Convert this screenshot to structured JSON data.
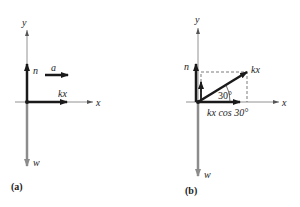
{
  "panels": [
    {
      "id": "a",
      "caption": "(a)",
      "axes": {
        "x_label": "x",
        "y_label": "y"
      },
      "vectors": [
        {
          "name": "n",
          "label": "n",
          "direction": "up"
        },
        {
          "name": "a",
          "label": "a",
          "direction": "right"
        },
        {
          "name": "kx",
          "label": "kx",
          "direction": "right"
        },
        {
          "name": "w",
          "label": "w",
          "direction": "down"
        }
      ]
    },
    {
      "id": "b",
      "caption": "(b)",
      "axes": {
        "x_label": "x",
        "y_label": "y"
      },
      "angle_label": "30°",
      "component_label": "kx cos 30°",
      "vectors": [
        {
          "name": "n",
          "label": "n",
          "direction": "up"
        },
        {
          "name": "kx",
          "label": "kx",
          "direction": "30° above x"
        },
        {
          "name": "w",
          "label": "w",
          "direction": "down"
        }
      ]
    }
  ],
  "colors": {
    "dark": "#1a1a1a",
    "gray": "#8c8c8c",
    "axis": "#777777"
  }
}
